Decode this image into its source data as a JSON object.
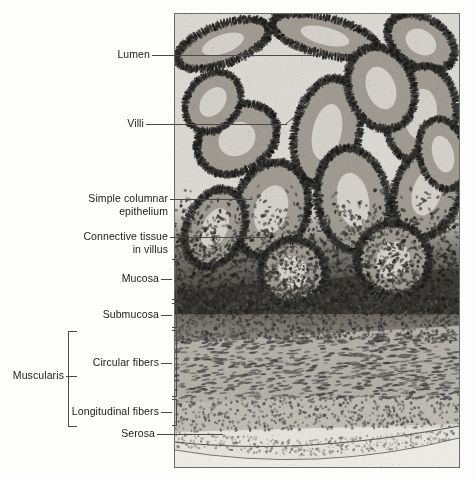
{
  "figure": {
    "background_color": "#fdfdfb",
    "line_color": "#4a4a4a",
    "text_color": "#1b1b1b"
  },
  "micrograph": {
    "name": "small-intestine-cross-section-micrograph",
    "description": "Light micrograph cross section of small intestine wall showing villi, mucosa, submucosa, muscularis and serosa",
    "border_color": "#6b6b6b"
  },
  "labels": [
    {
      "id": "lumen",
      "text": "Lumen"
    },
    {
      "id": "villi",
      "text": "Villi"
    },
    {
      "id": "simple-columnar",
      "text": "Simple columnar\nepithelium"
    },
    {
      "id": "connective-tissue",
      "text": "Connective tissue\nin villus"
    },
    {
      "id": "mucosa",
      "text": "Mucosa"
    },
    {
      "id": "submucosa",
      "text": "Submucosa"
    },
    {
      "id": "circular-fibers",
      "text": "Circular fibers"
    },
    {
      "id": "longitudinal-fibers",
      "text": "Longitudinal fibers"
    },
    {
      "id": "serosa",
      "text": "Serosa"
    },
    {
      "id": "muscularis",
      "text": "Muscularis"
    }
  ]
}
